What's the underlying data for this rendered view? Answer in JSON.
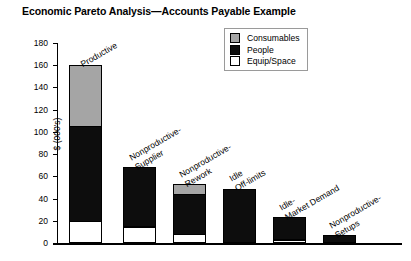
{
  "title": "Economic Pareto Analysis—Accounts Payable Example",
  "legend": {
    "items": [
      {
        "label": "Consumables",
        "key": "cons",
        "color": "#a5a5a5"
      },
      {
        "label": "People",
        "key": "people",
        "color": "#0d0d0d"
      },
      {
        "label": "Equip/Space",
        "key": "equip",
        "color": "#ffffff"
      }
    ]
  },
  "axes": {
    "ylabel": "$ (000's)",
    "yticks": [
      "0",
      "20",
      "40",
      "60",
      "80",
      "100",
      "120",
      "140",
      "160",
      "180"
    ]
  },
  "chart_data": {
    "type": "bar",
    "title": "Economic Pareto Analysis—Accounts Payable Example",
    "subtype": "stacked",
    "xlabel": "",
    "ylabel": "$ (000's)",
    "ylim": [
      0,
      180
    ],
    "ytick_step": 20,
    "grid": false,
    "legend_position": "top-right",
    "categories": [
      "Productive",
      "Nonproductive-\nSupplier",
      "Nonproductive-\nRework",
      "Idle\nOff-limits",
      "Idle-\nMarket Demand",
      "Nonproductive-\nSetups"
    ],
    "series": [
      {
        "name": "Equip/Space",
        "color": "#ffffff",
        "values": [
          20,
          14,
          8,
          0,
          3,
          0
        ]
      },
      {
        "name": "People",
        "color": "#0d0d0d",
        "values": [
          85,
          54,
          36,
          49,
          20,
          7
        ]
      },
      {
        "name": "Consumables",
        "color": "#a5a5a5",
        "values": [
          55,
          0,
          9,
          0,
          0,
          0
        ]
      }
    ],
    "totals": [
      160,
      68,
      53,
      49,
      23,
      7
    ]
  }
}
